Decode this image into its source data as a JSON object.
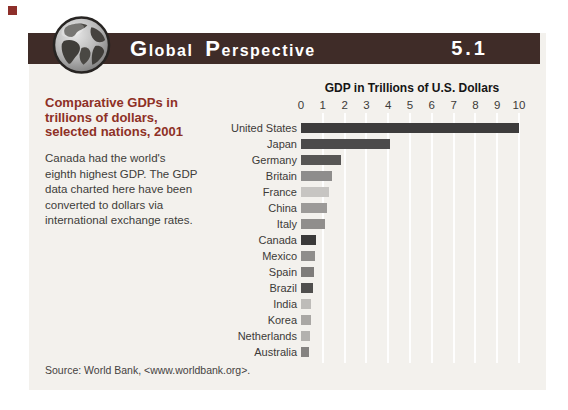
{
  "accent": {
    "corner_square_color": "#8e2f2a",
    "header_bar_color": "#3f2c28",
    "heading_color": "#8e3026",
    "panel_color": "#f3f1ed"
  },
  "header": {
    "title_cap1": "G",
    "title_rest1": "lobal",
    "title_cap2": "P",
    "title_rest2": "erspective",
    "number": "5.1",
    "globe_icon": "globe-icon"
  },
  "left_column": {
    "heading_lines": [
      "Comparative GDPs in",
      "trillions of dollars,",
      "selected nations, 2001"
    ],
    "body_lines": [
      "Canada had the world's",
      "eighth highest GDP. The GDP",
      "data charted here have been",
      "converted to dollars via",
      "international exchange rates."
    ]
  },
  "source_note": "Source: World Bank, <www.worldbank.org>.",
  "chart_data": {
    "type": "bar",
    "orientation": "horizontal",
    "title": "GDP in Trillions of U.S. Dollars",
    "xlabel": "GDP in Trillions of U.S. Dollars",
    "ylabel": "",
    "xlim": [
      0,
      10
    ],
    "xticks": [
      0,
      1,
      2,
      3,
      4,
      5,
      6,
      7,
      8,
      9,
      10
    ],
    "grid": true,
    "legend": "none",
    "categories": [
      "United States",
      "Japan",
      "Germany",
      "Britain",
      "France",
      "China",
      "Italy",
      "Canada",
      "Mexico",
      "Spain",
      "Brazil",
      "India",
      "Korea",
      "Netherlands",
      "Australia"
    ],
    "values": [
      10.0,
      4.1,
      1.85,
      1.4,
      1.3,
      1.2,
      1.1,
      0.7,
      0.62,
      0.58,
      0.53,
      0.48,
      0.44,
      0.4,
      0.35
    ],
    "bar_colors": [
      "#3d3c3c",
      "#4c4b4b",
      "#575655",
      "#8e8d8c",
      "#c7c5c2",
      "#9c9a98",
      "#908e8c",
      "#3a3939",
      "#8f8d8b",
      "#7e7c7a",
      "#504f4e",
      "#bebcb9",
      "#a9a7a4",
      "#b3b1ae",
      "#858381"
    ]
  }
}
